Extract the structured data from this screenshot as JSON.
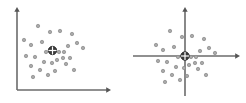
{
  "figure": {
    "title": "",
    "width": 246,
    "height": 103,
    "background": "#ffffff",
    "panel_count": 2
  },
  "colors": {
    "axis": "#6b6b6b",
    "axis_dark": "#555555",
    "point_fill": "#a9a9a9",
    "point_stroke": "#8a8a8a",
    "centroid_fill": "#3a3a3a",
    "centroid_stroke": "#2b2b2b",
    "crosshair": "#ffffff",
    "background": "#ffffff"
  },
  "chart_data": [
    {
      "type": "scatter",
      "name": "original-coordinates",
      "title": "",
      "xlabel": "",
      "ylabel": "",
      "grid": false,
      "legend": null,
      "axis_origin": [
        17,
        90
      ],
      "xlim": [
        17,
        108
      ],
      "ylim": [
        10,
        90
      ],
      "x_axis": {
        "x1": 17,
        "y1": 90,
        "x2": 108,
        "y2": 90,
        "arrow": "right"
      },
      "y_axis": {
        "x1": 17,
        "y1": 90,
        "x2": 17,
        "y2": 10,
        "arrow": "up"
      },
      "centroid": {
        "x": 52.5,
        "y": 50.5,
        "marker": "circle-crosshair",
        "r": 4.2
      },
      "points": [
        [
          38,
          26
        ],
        [
          50,
          32
        ],
        [
          24,
          40
        ],
        [
          42,
          42
        ],
        [
          31,
          45
        ],
        [
          60,
          31
        ],
        [
          72,
          34
        ],
        [
          77,
          43
        ],
        [
          83,
          48
        ],
        [
          68,
          46
        ],
        [
          64,
          52
        ],
        [
          59,
          52
        ],
        [
          63,
          58
        ],
        [
          57,
          60
        ],
        [
          70,
          58
        ],
        [
          26,
          56
        ],
        [
          35,
          57
        ],
        [
          44,
          62
        ],
        [
          52,
          63
        ],
        [
          31,
          66
        ],
        [
          40,
          70
        ],
        [
          55,
          71
        ],
        [
          74,
          70
        ],
        [
          48,
          75
        ],
        [
          33,
          77
        ],
        [
          66,
          64
        ],
        [
          46,
          52
        ]
      ]
    },
    {
      "type": "scatter",
      "name": "mean-centered-coordinates",
      "title": "",
      "xlabel": "",
      "ylabel": "",
      "grid": false,
      "legend": null,
      "axis_origin": [
        185,
        56
      ],
      "xlim": [
        133,
        237
      ],
      "ylim": [
        10,
        96
      ],
      "x_axis": {
        "x1": 133,
        "y1": 56,
        "x2": 237,
        "y2": 56,
        "arrow": "right"
      },
      "y_axis": {
        "x1": 185,
        "y1": 96,
        "x2": 185,
        "y2": 10,
        "arrow": "up"
      },
      "centroid": {
        "x": 185,
        "y": 56,
        "marker": "circle-crosshair",
        "r": 4.2
      },
      "points": [
        [
          170,
          31
        ],
        [
          182,
          37
        ],
        [
          156,
          45
        ],
        [
          174,
          47
        ],
        [
          163,
          50
        ],
        [
          192,
          36
        ],
        [
          204,
          39
        ],
        [
          209,
          48
        ],
        [
          215,
          53
        ],
        [
          200,
          51
        ],
        [
          196,
          57
        ],
        [
          191,
          57
        ],
        [
          195,
          63
        ],
        [
          189,
          65
        ],
        [
          202,
          63
        ],
        [
          158,
          61
        ],
        [
          167,
          62
        ],
        [
          176,
          67
        ],
        [
          184,
          68
        ],
        [
          163,
          71
        ],
        [
          172,
          75
        ],
        [
          187,
          76
        ],
        [
          206,
          75
        ],
        [
          180,
          80
        ],
        [
          165,
          82
        ],
        [
          198,
          69
        ],
        [
          178,
          57
        ]
      ]
    }
  ],
  "panels": [
    {
      "id": "original",
      "label": "Original coordinate axes at lower-left",
      "axes_style": "corner"
    },
    {
      "id": "centered",
      "label": "Axes translated to data centroid",
      "axes_style": "cross"
    }
  ]
}
